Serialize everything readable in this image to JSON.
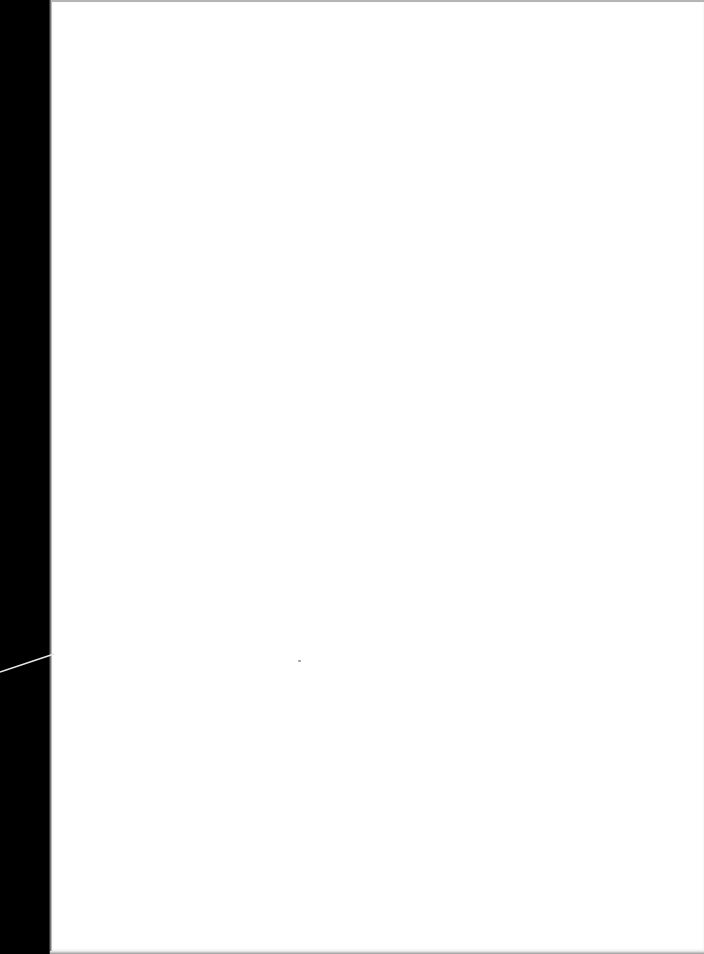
{
  "scene": {
    "description": "Blank white sheet of paper on a black surface",
    "background_color": "#000000",
    "paper_color": "#ffffff",
    "cable_color": "#e8e8e8",
    "visible_text": ""
  }
}
